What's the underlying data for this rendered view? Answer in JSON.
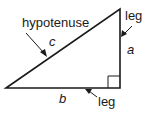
{
  "diagram": {
    "labels": {
      "hypotenuse": "hypotenuse",
      "side_c": "c",
      "leg_top": "leg",
      "side_a": "a",
      "side_b": "b",
      "leg_bottom": "leg"
    },
    "colors": {
      "stroke": "#1a1a1a",
      "background": "#ffffff"
    }
  }
}
